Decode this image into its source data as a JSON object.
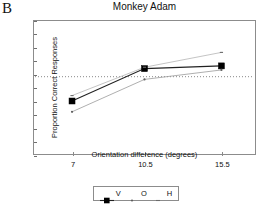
{
  "panel_label": "B",
  "axes": {
    "y_ticks": [
      50,
      55,
      60,
      65,
      70,
      75,
      80,
      85,
      90,
      95,
      100
    ],
    "x_ticks": [
      "7",
      "10.5",
      "15.5"
    ]
  },
  "legend": {
    "entries": [
      {
        "label": "V",
        "key": "filled-square-line",
        "color": "#000000"
      },
      {
        "label": "O",
        "key": "small-dot",
        "color": "#555555"
      },
      {
        "label": "H",
        "key": "small-dash",
        "color": "#777777"
      }
    ]
  },
  "chart_data": {
    "type": "line",
    "title": "Monkey Adam",
    "xlabel": "Orientation difference (degrees)",
    "ylabel": "Proportion Correct Responses",
    "x": [
      7,
      10.5,
      15.5
    ],
    "xtick_labels": [
      "7",
      "10.5",
      "15.5"
    ],
    "ylim": [
      50,
      100
    ],
    "ytick_labels": [
      "50",
      "55",
      "60",
      "65",
      "70",
      "75",
      "80",
      "85",
      "90",
      "95",
      "100"
    ],
    "grid": false,
    "legend_position": "below-axes",
    "reference_line": {
      "value": 79,
      "style": "dotted",
      "orientation": "horizontal"
    },
    "series": [
      {
        "name": "V",
        "marker": "filled-square",
        "values": [
          70,
          82,
          83
        ]
      },
      {
        "name": "O",
        "marker": "small-dot",
        "values": [
          66,
          78,
          81.5
        ]
      },
      {
        "name": "H",
        "marker": "small-dash",
        "values": [
          72,
          82.5,
          88
        ]
      }
    ]
  }
}
